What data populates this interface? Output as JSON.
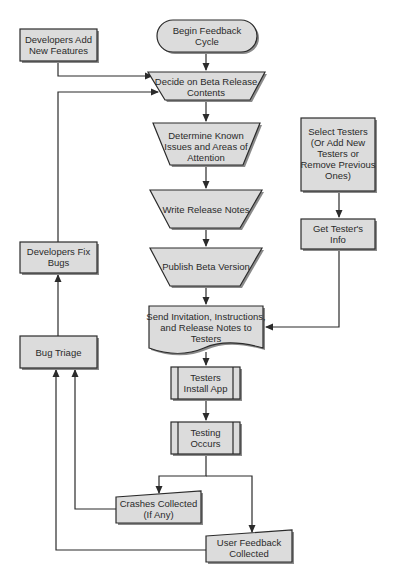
{
  "colors": {
    "fill": "#dcdcdc",
    "stroke": "#2b2b2b",
    "shadow": "#8a8a8a",
    "background": "#ffffff"
  },
  "nodes": {
    "begin": {
      "shape": "terminator",
      "lines": [
        "Begin Feedback",
        "Cycle"
      ]
    },
    "dev_add": {
      "shape": "process",
      "lines": [
        "Developers Add",
        "New Features"
      ]
    },
    "decide": {
      "shape": "manual-operation",
      "lines": [
        "Decide on Beta Release",
        "Contents"
      ]
    },
    "determine": {
      "shape": "manual-operation",
      "lines": [
        "Determine Known",
        "Issues and Areas of",
        "Attention"
      ]
    },
    "write_notes": {
      "shape": "manual-operation",
      "lines": [
        "Write Release Notes"
      ]
    },
    "publish": {
      "shape": "manual-operation",
      "lines": [
        "Publish Beta Version"
      ]
    },
    "send_invite": {
      "shape": "document",
      "lines": [
        "Send Invitation, Instructions,",
        "and Release Notes to",
        "Testers"
      ]
    },
    "install": {
      "shape": "predefined-process",
      "lines": [
        "Testers",
        "Install App"
      ]
    },
    "testing": {
      "shape": "predefined-process",
      "lines": [
        "Testing",
        "Occurs"
      ]
    },
    "crashes": {
      "shape": "manual-input",
      "lines": [
        "Crashes Collected",
        "(If Any)"
      ]
    },
    "feedback": {
      "shape": "manual-input",
      "lines": [
        "User Feedback",
        "Collected"
      ]
    },
    "select_testers": {
      "shape": "process",
      "lines": [
        "Select Testers",
        "(Or Add New",
        "Testers or",
        "Remove Previous",
        "Ones)"
      ]
    },
    "tester_info": {
      "shape": "process",
      "lines": [
        "Get Tester's",
        "Info"
      ]
    },
    "dev_fix": {
      "shape": "process",
      "lines": [
        "Developers Fix",
        "Bugs"
      ]
    },
    "bug_triage": {
      "shape": "process",
      "lines": [
        "Bug Triage"
      ]
    }
  },
  "edges": [
    [
      "begin",
      "decide"
    ],
    [
      "dev_add",
      "decide"
    ],
    [
      "dev_fix",
      "decide"
    ],
    [
      "decide",
      "determine"
    ],
    [
      "determine",
      "write_notes"
    ],
    [
      "write_notes",
      "publish"
    ],
    [
      "publish",
      "send_invite"
    ],
    [
      "select_testers",
      "tester_info"
    ],
    [
      "tester_info",
      "send_invite"
    ],
    [
      "send_invite",
      "install"
    ],
    [
      "install",
      "testing"
    ],
    [
      "testing",
      "crashes"
    ],
    [
      "testing",
      "feedback"
    ],
    [
      "crashes",
      "bug_triage"
    ],
    [
      "feedback",
      "bug_triage"
    ],
    [
      "bug_triage",
      "dev_fix"
    ]
  ]
}
